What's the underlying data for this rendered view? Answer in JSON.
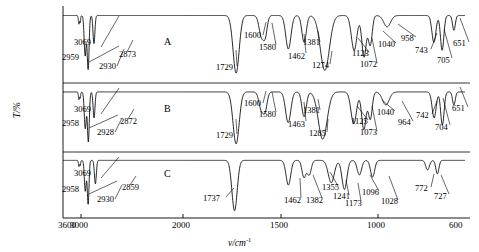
{
  "axes": {
    "x_title": "v/cm",
    "x_title_sup": "-1",
    "y_title": "T/%",
    "x_ticks": [
      {
        "label": "3600",
        "wn": 3600,
        "px": 63
      },
      {
        "label": "3000",
        "wn": 3000,
        "px": 81
      },
      {
        "label": "2000",
        "wn": 2000,
        "px": 183
      },
      {
        "label": "1500",
        "wn": 1500,
        "px": 281
      },
      {
        "label": "1000",
        "wn": 1000,
        "px": 378
      },
      {
        "label": "600",
        "wn": 600,
        "px": 465
      }
    ],
    "x_range": [
      3600,
      600
    ]
  },
  "panels": [
    {
      "letter": "A",
      "letter_x": 164,
      "letter_y": 36
    },
    {
      "letter": "B",
      "letter_x": 164,
      "letter_y": 103
    },
    {
      "letter": "C",
      "letter_x": 164,
      "letter_y": 168
    }
  ],
  "chart_data": {
    "type": "line",
    "title": "",
    "xlabel": "v/cm-1",
    "ylabel": "T/%",
    "xlim": [
      3600,
      600
    ],
    "grid": false,
    "legend": "none",
    "series": [
      {
        "name": "A",
        "peaks": [
          3069,
          2959,
          2930,
          2873,
          1729,
          1600,
          1580,
          1462,
          1381,
          1274,
          1123,
          1072,
          1040,
          958,
          743,
          705,
          651
        ]
      },
      {
        "name": "B",
        "peaks": [
          3069,
          2958,
          2928,
          2872,
          1729,
          1600,
          1580,
          1463,
          1381,
          1285,
          1125,
          1073,
          1040,
          964,
          742,
          704,
          651
        ]
      },
      {
        "name": "C",
        "peaks": [
          3069,
          2958,
          2930,
          2859,
          1737,
          1462,
          1382,
          1355,
          1241,
          1173,
          1096,
          1028,
          772,
          727
        ]
      }
    ]
  },
  "annotations": {
    "A": [
      {
        "text": "3069",
        "x": 74,
        "y": 38,
        "lx": 101,
        "ly": 47,
        "tx": 119,
        "ty": 16
      },
      {
        "text": "2959",
        "x": 62,
        "y": 53,
        "lx": 89,
        "ly": 62,
        "tx": 119,
        "ty": 46
      },
      {
        "text": "2930",
        "x": 99,
        "y": 62,
        "lx": 117,
        "ly": 66,
        "tx": 124,
        "ty": 49
      },
      {
        "text": "2873",
        "x": 119,
        "y": 50,
        "lx": 127,
        "ly": 52,
        "tx": 133,
        "ty": 40
      },
      {
        "text": "1729",
        "x": 216,
        "y": 63,
        "lx": 237,
        "ly": 66,
        "tx": 236,
        "ty": 50
      },
      {
        "text": "1600",
        "x": 244,
        "y": 31,
        "lx": 263,
        "ly": 35,
        "tx": 266,
        "ty": 22
      },
      {
        "text": "1580",
        "x": 259,
        "y": 43,
        "lx": 276,
        "ly": 45,
        "tx": 272,
        "ty": 23
      },
      {
        "text": "1462",
        "x": 288,
        "y": 52,
        "lx": 306,
        "ly": 53,
        "tx": 304,
        "ty": 34
      },
      {
        "text": "1381",
        "x": 303,
        "y": 38,
        "lx": 320,
        "ly": 42,
        "tx": 318,
        "ty": 31
      },
      {
        "text": "1274",
        "x": 312,
        "y": 61,
        "lx": 330,
        "ly": 64,
        "tx": 332,
        "ty": 51
      },
      {
        "text": "1123",
        "x": 352,
        "y": 49,
        "lx": 369,
        "ly": 52,
        "tx": 358,
        "ty": 38
      },
      {
        "text": "1072",
        "x": 360,
        "y": 60,
        "lx": 377,
        "ly": 63,
        "tx": 372,
        "ty": 38
      },
      {
        "text": "1040",
        "x": 378,
        "y": 40,
        "lx": 396,
        "ly": 43,
        "tx": 383,
        "ty": 31
      },
      {
        "text": "958",
        "x": 401,
        "y": 34,
        "lx": 416,
        "ly": 37,
        "tx": 398,
        "ty": 24
      },
      {
        "text": "743",
        "x": 415,
        "y": 46,
        "lx": 431,
        "ly": 49,
        "tx": 437,
        "ty": 33
      },
      {
        "text": "705",
        "x": 437,
        "y": 56,
        "lx": 452,
        "ly": 58,
        "tx": 444,
        "ty": 29
      },
      {
        "text": "651",
        "x": 453,
        "y": 39,
        "lx": 469,
        "ly": 42,
        "tx": 460,
        "ty": 18
      }
    ],
    "B": [
      {
        "text": "3069",
        "x": 74,
        "y": 105,
        "lx": 101,
        "ly": 114,
        "tx": 119,
        "ty": 88
      },
      {
        "text": "2958",
        "x": 62,
        "y": 119,
        "lx": 89,
        "ly": 128,
        "tx": 118,
        "ty": 115
      },
      {
        "text": "2928",
        "x": 97,
        "y": 128,
        "lx": 115,
        "ly": 132,
        "tx": 122,
        "ty": 118
      },
      {
        "text": "2872",
        "x": 120,
        "y": 117,
        "lx": 128,
        "ly": 119,
        "tx": 134,
        "ty": 109
      },
      {
        "text": "1729",
        "x": 216,
        "y": 131,
        "lx": 237,
        "ly": 134,
        "tx": 236,
        "ty": 119
      },
      {
        "text": "1600",
        "x": 244,
        "y": 99,
        "lx": 263,
        "ly": 103,
        "tx": 266,
        "ty": 91
      },
      {
        "text": "1580",
        "x": 259,
        "y": 110,
        "lx": 276,
        "ly": 112,
        "tx": 272,
        "ty": 92
      },
      {
        "text": "1463",
        "x": 288,
        "y": 120,
        "lx": 306,
        "ly": 121,
        "tx": 304,
        "ty": 102
      },
      {
        "text": "1381",
        "x": 303,
        "y": 106,
        "lx": 320,
        "ly": 110,
        "tx": 318,
        "ty": 99
      },
      {
        "text": "1285",
        "x": 309,
        "y": 129,
        "lx": 327,
        "ly": 132,
        "tx": 328,
        "ty": 119
      },
      {
        "text": "1125",
        "x": 351,
        "y": 117,
        "lx": 368,
        "ly": 120,
        "tx": 357,
        "ty": 106
      },
      {
        "text": "1073",
        "x": 360,
        "y": 128,
        "lx": 377,
        "ly": 131,
        "tx": 372,
        "ty": 106
      },
      {
        "text": "1040",
        "x": 377,
        "y": 108,
        "lx": 395,
        "ly": 111,
        "tx": 382,
        "ty": 100
      },
      {
        "text": "964",
        "x": 398,
        "y": 118,
        "lx": 413,
        "ly": 121,
        "tx": 402,
        "ty": 101
      },
      {
        "text": "742",
        "x": 416,
        "y": 111,
        "lx": 432,
        "ly": 114,
        "tx": 437,
        "ty": 101
      },
      {
        "text": "704",
        "x": 435,
        "y": 123,
        "lx": 450,
        "ly": 125,
        "tx": 443,
        "ty": 98
      },
      {
        "text": "651",
        "x": 452,
        "y": 104,
        "lx": 468,
        "ly": 107,
        "tx": 460,
        "ty": 87
      }
    ],
    "C": [
      {
        "text": "3069",
        "x": 74,
        "y": 169,
        "lx": 101,
        "ly": 178,
        "tx": 119,
        "ty": 157
      },
      {
        "text": "2958",
        "x": 62,
        "y": 185,
        "lx": 89,
        "ly": 194,
        "tx": 117,
        "ty": 181
      },
      {
        "text": "2930",
        "x": 97,
        "y": 195,
        "lx": 115,
        "ly": 199,
        "tx": 122,
        "ty": 185
      },
      {
        "text": "2859",
        "x": 122,
        "y": 183,
        "lx": 130,
        "ly": 185,
        "tx": 136,
        "ty": 176
      },
      {
        "text": "1737",
        "x": 203,
        "y": 194,
        "lx": 226,
        "ly": 197,
        "tx": 234,
        "ty": 188
      },
      {
        "text": "1462",
        "x": 284,
        "y": 196,
        "lx": 301,
        "ly": 198,
        "tx": 300,
        "ty": 178
      },
      {
        "text": "1382",
        "x": 306,
        "y": 196,
        "lx": 322,
        "ly": 198,
        "tx": 313,
        "ty": 175
      },
      {
        "text": "1355",
        "x": 322,
        "y": 183,
        "lx": 338,
        "ly": 186,
        "tx": 330,
        "ty": 172
      },
      {
        "text": "1241",
        "x": 333,
        "y": 192,
        "lx": 349,
        "ly": 195,
        "tx": 346,
        "ty": 180
      },
      {
        "text": "1173",
        "x": 345,
        "y": 199,
        "lx": 361,
        "ly": 201,
        "tx": 358,
        "ty": 183
      },
      {
        "text": "1096",
        "x": 362,
        "y": 188,
        "lx": 379,
        "ly": 191,
        "tx": 370,
        "ty": 175
      },
      {
        "text": "1028",
        "x": 381,
        "y": 197,
        "lx": 398,
        "ly": 200,
        "tx": 389,
        "ty": 176
      },
      {
        "text": "772",
        "x": 415,
        "y": 184,
        "lx": 431,
        "ly": 187,
        "tx": 434,
        "ty": 174
      },
      {
        "text": "727",
        "x": 434,
        "y": 192,
        "lx": 449,
        "ly": 194,
        "tx": 441,
        "ty": 175
      }
    ]
  }
}
